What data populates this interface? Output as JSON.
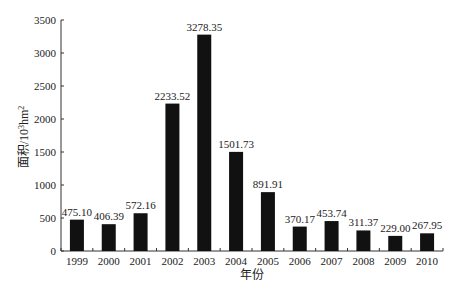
{
  "chart_data": {
    "type": "bar",
    "title": "",
    "xlabel": "年份",
    "ylabel": "面积/10³hm²",
    "ylabel_parts": {
      "main": "面积/10",
      "sup1": "3",
      "mid": "hm",
      "sup2": "2"
    },
    "categories": [
      "1999",
      "2000",
      "2001",
      "2002",
      "2003",
      "2004",
      "2005",
      "2006",
      "2007",
      "2008",
      "2009",
      "2010"
    ],
    "values": [
      475.1,
      406.39,
      572.16,
      2233.52,
      3278.35,
      1501.73,
      891.91,
      370.17,
      453.74,
      311.37,
      229.0,
      267.95
    ],
    "value_labels": [
      "475.10",
      "406.39",
      "572.16",
      "2233.52",
      "3278.35",
      "1501.73",
      "891.91",
      "370.17",
      "453.74",
      "311.37",
      "229.00",
      "267.95"
    ],
    "ylim": [
      0,
      3500
    ],
    "yticks": [
      0,
      500,
      1000,
      1500,
      2000,
      2500,
      3000,
      3500
    ],
    "grid": false,
    "legend": null,
    "bar_color": "#111111"
  }
}
